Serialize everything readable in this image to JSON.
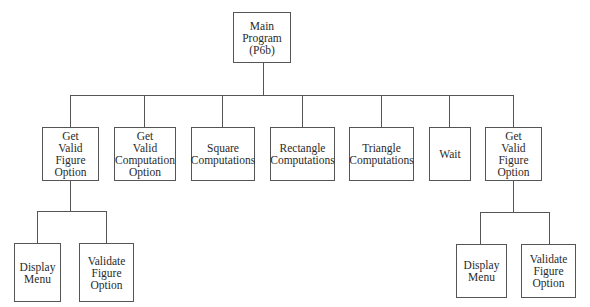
{
  "diagram": {
    "type": "structure-chart",
    "root": {
      "id": "main",
      "label": "Main\nProgram\n(P6b)"
    },
    "level1": [
      {
        "id": "get-valid-figure-option-1",
        "label": "Get\nValid\nFigure\nOption"
      },
      {
        "id": "get-valid-computation-option",
        "label": "Get\nValid\nComputation\nOption"
      },
      {
        "id": "square-computations",
        "label": "Square\nComputations"
      },
      {
        "id": "rectangle-computations",
        "label": "Rectangle\nComputations"
      },
      {
        "id": "triangle-computations",
        "label": "Triangle\nComputations"
      },
      {
        "id": "wait",
        "label": "Wait"
      },
      {
        "id": "get-valid-figure-option-2",
        "label": "Get\nValid\nFigure\nOption"
      }
    ],
    "level2_left": [
      {
        "id": "display-menu-1",
        "label": "Display\nMenu"
      },
      {
        "id": "validate-figure-option-1",
        "label": "Validate\nFigure\nOption"
      }
    ],
    "level2_right": [
      {
        "id": "display-menu-2",
        "label": "Display\nMenu"
      },
      {
        "id": "validate-figure-option-2",
        "label": "Validate\nFigure\nOption"
      }
    ],
    "edges": [
      [
        "main",
        "get-valid-figure-option-1"
      ],
      [
        "main",
        "get-valid-computation-option"
      ],
      [
        "main",
        "square-computations"
      ],
      [
        "main",
        "rectangle-computations"
      ],
      [
        "main",
        "triangle-computations"
      ],
      [
        "main",
        "wait"
      ],
      [
        "main",
        "get-valid-figure-option-2"
      ],
      [
        "get-valid-figure-option-1",
        "display-menu-1"
      ],
      [
        "get-valid-figure-option-1",
        "validate-figure-option-1"
      ],
      [
        "get-valid-figure-option-2",
        "display-menu-2"
      ],
      [
        "get-valid-figure-option-2",
        "validate-figure-option-2"
      ]
    ]
  }
}
